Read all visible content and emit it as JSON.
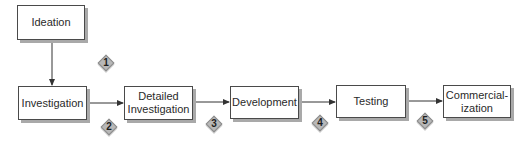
{
  "diagram": {
    "type": "process-flow",
    "colors": {
      "box_border": "#4a4a4a",
      "box_shadow": "#a9a9a9",
      "arrow": "#333333",
      "diamond_fill": "#b8b8b8",
      "diamond_border": "#8a8a8a"
    },
    "stages": [
      {
        "id": "ideation",
        "label": "Ideation"
      },
      {
        "id": "investigation",
        "label": "Investigation"
      },
      {
        "id": "detailed-investigation",
        "label": "Detailed\nInvestigation"
      },
      {
        "id": "development",
        "label": "Development"
      },
      {
        "id": "testing",
        "label": "Testing"
      },
      {
        "id": "commercialization",
        "label": "Commercial-\nization"
      }
    ],
    "gates": [
      {
        "label": "1",
        "between": [
          "Ideation",
          "Investigation"
        ]
      },
      {
        "label": "2",
        "between": [
          "Investigation",
          "Detailed Investigation"
        ]
      },
      {
        "label": "3",
        "between": [
          "Detailed Investigation",
          "Development"
        ]
      },
      {
        "label": "4",
        "between": [
          "Development",
          "Testing"
        ]
      },
      {
        "label": "5",
        "between": [
          "Testing",
          "Commercialization"
        ]
      }
    ],
    "edges": [
      {
        "from": "Ideation",
        "to": "Investigation",
        "direction": "down"
      },
      {
        "from": "Investigation",
        "to": "Detailed Investigation",
        "direction": "right"
      },
      {
        "from": "Detailed Investigation",
        "to": "Development",
        "direction": "right"
      },
      {
        "from": "Development",
        "to": "Testing",
        "direction": "right"
      },
      {
        "from": "Testing",
        "to": "Commercialization",
        "direction": "right"
      }
    ]
  }
}
